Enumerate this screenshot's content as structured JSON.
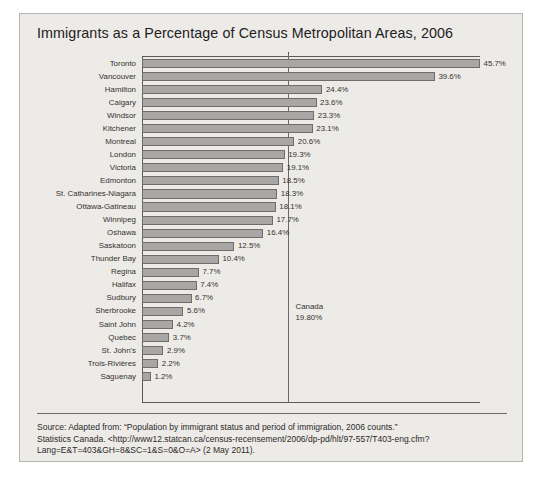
{
  "card": {
    "title": "Immigrants as a Percentage of Census Metropolitan Areas, 2006"
  },
  "annotation": {
    "region_label": "Canada",
    "region_value": "19.80%"
  },
  "source": {
    "line1": "Source: Adapted from: “Population by immigrant status and period of immigration, 2006 counts.”",
    "line2": "Statistics Canada. <http://www12.statcan.ca/census-recensement/2006/dp-pd/hlt/97-557/T403-eng.cfm?",
    "line3": "Lang=E&T=403&GH=8&SC=1&S=0&O=A> (2 May 2011)."
  },
  "chart_data": {
    "type": "bar",
    "orientation": "horizontal",
    "title": "Immigrants as a Percentage of Census Metropolitan Areas, 2006",
    "xlabel": "",
    "ylabel": "",
    "xlim": [
      0,
      45.7
    ],
    "grid": false,
    "legend": null,
    "reference_line": {
      "label": "Canada",
      "value": 19.8,
      "value_label": "19.80%"
    },
    "categories": [
      "Toronto",
      "Vancouver",
      "Hamilton",
      "Calgary",
      "Windsor",
      "Kitchener",
      "Montreal",
      "London",
      "Victoria",
      "Edmonton",
      "St. Catharines-Niagara",
      "Ottawa-Gatineau",
      "Winnipeg",
      "Oshawa",
      "Saskatoon",
      "Thunder Bay",
      "Regina",
      "Halifax",
      "Sudbury",
      "Sherbrooke",
      "Saint John",
      "Quebec",
      "St. John's",
      "Trois-Rivières",
      "Saguenay"
    ],
    "values": [
      45.7,
      39.6,
      24.4,
      23.6,
      23.3,
      23.1,
      20.6,
      19.3,
      19.1,
      18.5,
      18.3,
      18.1,
      17.7,
      16.4,
      12.5,
      10.4,
      7.7,
      7.4,
      6.7,
      5.6,
      4.2,
      3.7,
      2.9,
      2.2,
      1.2
    ],
    "value_labels": [
      "45.7%",
      "39.6%",
      "24.4%",
      "23.6%",
      "23.3%",
      "23.1%",
      "20.6%",
      "19.3%",
      "19.1%",
      "18.5%",
      "18.3%",
      "18.1%",
      "17.7%",
      "16.4%",
      "12.5%",
      "10.4%",
      "7.7%",
      "7.4%",
      "6.7%",
      "5.6%",
      "4.2%",
      "3.7%",
      "2.9%",
      "2.2%",
      "1.2%"
    ]
  }
}
